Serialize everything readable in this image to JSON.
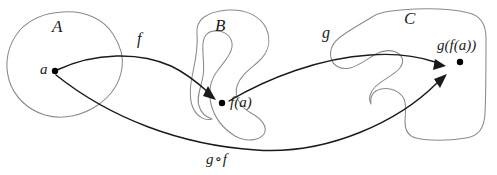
{
  "diagram": {
    "kind": "function-composition-venn-diagram",
    "background_color": "#ffffff",
    "outline_color": "#8a8a8a",
    "arrow_color": "#1a1a1a",
    "sets": [
      {
        "id": "A",
        "label": "A"
      },
      {
        "id": "B",
        "label": "B"
      },
      {
        "id": "C",
        "label": "C"
      }
    ],
    "points": [
      {
        "id": "a",
        "label": "a",
        "in_set": "A"
      },
      {
        "id": "fa",
        "label": "f(a)",
        "in_set": "B"
      },
      {
        "id": "gfa",
        "label": "g(f(a))",
        "in_set": "C"
      }
    ],
    "maps": [
      {
        "id": "f",
        "label": "f",
        "from": "A",
        "to": "B"
      },
      {
        "id": "g",
        "label": "g",
        "from": "B",
        "to": "C"
      },
      {
        "id": "gof",
        "label_left": "g",
        "label_op": "∘",
        "label_right": "f",
        "from": "A",
        "to": "C"
      }
    ]
  }
}
